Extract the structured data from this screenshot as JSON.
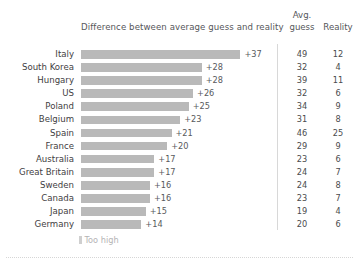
{
  "header": {
    "bar_column_title": "Difference between average guess and reality",
    "avg_line1": "Avg.",
    "avg_line2": "guess",
    "reality": "Reality"
  },
  "legend": {
    "label": "Too high",
    "swatch_color": "#cfcfcf"
  },
  "colors": {
    "bar": "#b9b9b9",
    "text": "#4a4a4a",
    "divider": "#d8d8d8",
    "background": "#ffffff"
  },
  "chart_data": {
    "type": "bar",
    "title": "Difference between average guess and reality",
    "xlabel": "",
    "ylabel": "",
    "orientation": "horizontal",
    "grid": false,
    "legend_position": "bottom-left",
    "legend_entries": [
      "Too high"
    ],
    "xlim": [
      0,
      40
    ],
    "categories": [
      "Italy",
      "South Korea",
      "Hungary",
      "US",
      "Poland",
      "Belgium",
      "Spain",
      "France",
      "Australia",
      "Great Britain",
      "Sweden",
      "Canada",
      "Japan",
      "Germany"
    ],
    "values": [
      37,
      28,
      28,
      26,
      25,
      23,
      21,
      20,
      17,
      17,
      16,
      16,
      15,
      14
    ],
    "value_labels": [
      "+37",
      "+28",
      "+28",
      "+26",
      "+25",
      "+23",
      "+21",
      "+20",
      "+17",
      "+17",
      "+16",
      "+16",
      "+15",
      "+14"
    ],
    "series": [
      {
        "name": "Difference between average guess and reality",
        "values": [
          37,
          28,
          28,
          26,
          25,
          23,
          21,
          20,
          17,
          17,
          16,
          16,
          15,
          14
        ]
      },
      {
        "name": "Avg. guess",
        "values": [
          49,
          32,
          39,
          32,
          34,
          31,
          46,
          29,
          23,
          24,
          24,
          23,
          19,
          20
        ]
      },
      {
        "name": "Reality",
        "values": [
          12,
          4,
          11,
          6,
          9,
          8,
          25,
          9,
          6,
          7,
          8,
          7,
          4,
          6
        ]
      }
    ]
  },
  "rows": [
    {
      "label": "Italy",
      "value": 37,
      "value_label": "+37",
      "guess": "49",
      "reality": "12"
    },
    {
      "label": "South Korea",
      "value": 28,
      "value_label": "+28",
      "guess": "32",
      "reality": "4"
    },
    {
      "label": "Hungary",
      "value": 28,
      "value_label": "+28",
      "guess": "39",
      "reality": "11"
    },
    {
      "label": "US",
      "value": 26,
      "value_label": "+26",
      "guess": "32",
      "reality": "6"
    },
    {
      "label": "Poland",
      "value": 25,
      "value_label": "+25",
      "guess": "34",
      "reality": "9"
    },
    {
      "label": "Belgium",
      "value": 23,
      "value_label": "+23",
      "guess": "31",
      "reality": "8"
    },
    {
      "label": "Spain",
      "value": 21,
      "value_label": "+21",
      "guess": "46",
      "reality": "25"
    },
    {
      "label": "France",
      "value": 20,
      "value_label": "+20",
      "guess": "29",
      "reality": "9"
    },
    {
      "label": "Australia",
      "value": 17,
      "value_label": "+17",
      "guess": "23",
      "reality": "6"
    },
    {
      "label": "Great Britain",
      "value": 17,
      "value_label": "+17",
      "guess": "24",
      "reality": "7"
    },
    {
      "label": "Sweden",
      "value": 16,
      "value_label": "+16",
      "guess": "24",
      "reality": "8"
    },
    {
      "label": "Canada",
      "value": 16,
      "value_label": "+16",
      "guess": "23",
      "reality": "7"
    },
    {
      "label": "Japan",
      "value": 15,
      "value_label": "+15",
      "guess": "19",
      "reality": "4"
    },
    {
      "label": "Germany",
      "value": 14,
      "value_label": "+14",
      "guess": "20",
      "reality": "6"
    }
  ]
}
